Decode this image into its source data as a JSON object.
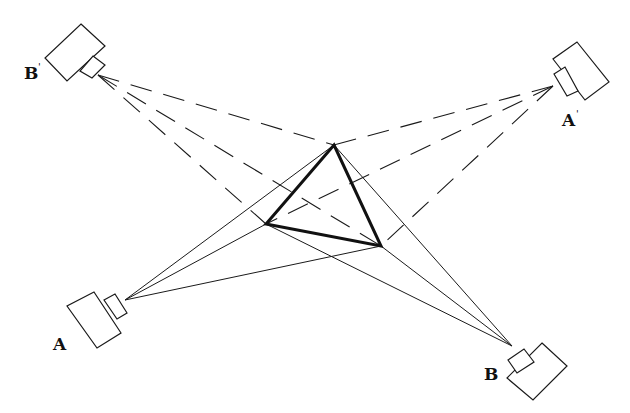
{
  "diagram": {
    "type": "stereo camera pair triangulation",
    "colors": {
      "stroke": "#1a1a1a",
      "background": "#ffffff"
    },
    "triangle": {
      "vertices": {
        "top": [
          334,
          145
        ],
        "left": [
          266,
          224
        ],
        "right": [
          381,
          246
        ]
      }
    },
    "cameras": [
      {
        "id": "A",
        "label": "A",
        "prime": "",
        "ray_style": "solid",
        "lens_point": [
          125,
          300
        ],
        "label_pos": [
          53,
          350
        ],
        "body": [
          [
            94,
            292
          ],
          [
            121,
            333
          ],
          [
            97,
            348
          ],
          [
            67,
            306
          ]
        ],
        "lens": [
          [
            104,
            300
          ],
          [
            115,
            294
          ],
          [
            127,
            313
          ],
          [
            117,
            319
          ]
        ]
      },
      {
        "id": "B",
        "label": "B",
        "prime": "",
        "ray_style": "solid",
        "lens_point": [
          512,
          346
        ],
        "label_pos": [
          484,
          380
        ],
        "body": [
          [
            542,
            343
          ],
          [
            567,
            366
          ],
          [
            533,
            400
          ],
          [
            507,
            378
          ]
        ],
        "lens": [
          [
            508,
            360
          ],
          [
            524,
            349
          ],
          [
            534,
            362
          ],
          [
            517,
            373
          ]
        ]
      },
      {
        "id": "A-prime",
        "label": "A",
        "prime": "'",
        "ray_style": "dashed",
        "lens_point": [
          553,
          86
        ],
        "label_pos": [
          562,
          126
        ],
        "body": [
          [
            577,
            42
          ],
          [
            609,
            82
          ],
          [
            585,
            100
          ],
          [
            553,
            59
          ]
        ],
        "lens": [
          [
            554,
            74
          ],
          [
            565,
            67
          ],
          [
            578,
            91
          ],
          [
            567,
            96
          ]
        ]
      },
      {
        "id": "B-prime",
        "label": "B",
        "prime": "'",
        "ray_style": "dashed",
        "lens_point": [
          98,
          75
        ],
        "label_pos": [
          24,
          79
        ],
        "body": [
          [
            81,
            24
          ],
          [
            105,
            46
          ],
          [
            67,
            81
          ],
          [
            45,
            58
          ]
        ],
        "lens": [
          [
            93,
            56
          ],
          [
            105,
            65
          ],
          [
            92,
            78
          ],
          [
            80,
            71
          ]
        ]
      }
    ]
  }
}
